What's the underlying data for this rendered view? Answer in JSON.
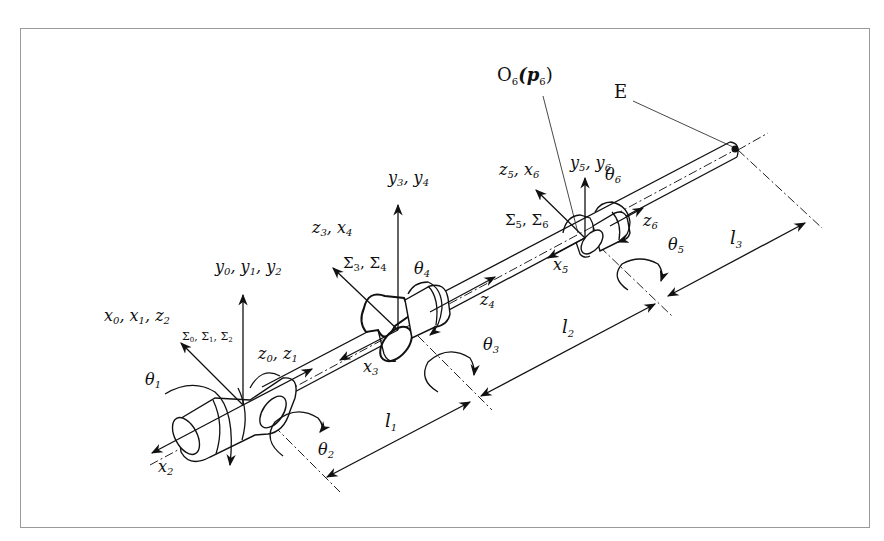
{
  "figure": {
    "type": "6-DOF manipulator kinematic diagram",
    "labels": {
      "origin_o6": {
        "main": "O",
        "sub": "6",
        "paren": "(p",
        "psub": "6",
        "close": ")"
      },
      "end_effector": "E",
      "frame_0_y": [
        {
          "v": "y",
          "s": "0"
        },
        {
          "v": "y",
          "s": "1"
        },
        {
          "v": "y",
          "s": "2"
        }
      ],
      "frame_0_x": [
        {
          "v": "x",
          "s": "0"
        },
        {
          "v": "x",
          "s": "1"
        },
        {
          "v": "z",
          "s": "2"
        }
      ],
      "frame_0_sigma": [
        {
          "v": "Σ",
          "s": "0"
        },
        {
          "v": "Σ",
          "s": "1"
        },
        {
          "v": "Σ",
          "s": "2"
        }
      ],
      "frame_0_z": [
        {
          "v": "z",
          "s": "0"
        },
        {
          "v": "z",
          "s": "1"
        }
      ],
      "frame_0_x2": {
        "v": "x",
        "s": "2"
      },
      "theta_1": {
        "v": "θ",
        "s": "1"
      },
      "theta_2": {
        "v": "θ",
        "s": "2"
      },
      "frame_3_y": [
        {
          "v": "y",
          "s": "3"
        },
        {
          "v": "y",
          "s": "4"
        }
      ],
      "frame_3_z": [
        {
          "v": "z",
          "s": "3"
        },
        {
          "v": "x",
          "s": "4"
        }
      ],
      "frame_3_sigma": [
        {
          "v": "Σ",
          "s": "3"
        },
        {
          "v": "Σ",
          "s": "4"
        }
      ],
      "frame_3_x3": {
        "v": "x",
        "s": "3"
      },
      "frame_4_z4": {
        "v": "z",
        "s": "4"
      },
      "theta_3": {
        "v": "θ",
        "s": "3"
      },
      "theta_4": {
        "v": "θ",
        "s": "4"
      },
      "frame_5_y": [
        {
          "v": "y",
          "s": "5"
        },
        {
          "v": "y",
          "s": "6"
        }
      ],
      "frame_5_z": [
        {
          "v": "z",
          "s": "5"
        },
        {
          "v": "x",
          "s": "6"
        }
      ],
      "frame_5_sigma": [
        {
          "v": "Σ",
          "s": "5"
        },
        {
          "v": "Σ",
          "s": "6"
        }
      ],
      "frame_5_x5": {
        "v": "x",
        "s": "5"
      },
      "frame_6_z6": {
        "v": "z",
        "s": "6"
      },
      "theta_5": {
        "v": "θ",
        "s": "5"
      },
      "theta_6": {
        "v": "θ",
        "s": "6"
      },
      "link_1": {
        "v": "l",
        "s": "1"
      },
      "link_2": {
        "v": "l",
        "s": "2"
      },
      "link_3": {
        "v": "l",
        "s": "3"
      }
    },
    "separator": ", "
  }
}
